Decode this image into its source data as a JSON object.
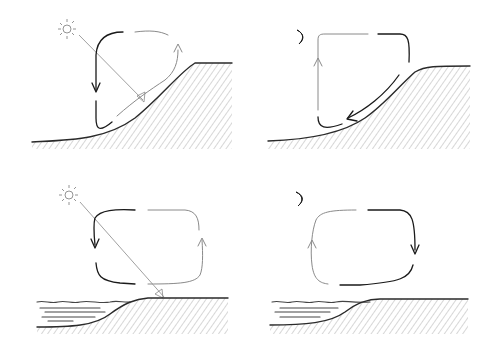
{
  "diagram": {
    "type": "atmospheric circulation sketches",
    "panels": [
      {
        "id": "day-slope",
        "celestial": "sun",
        "terrain": "slope",
        "flow": "upslope (anabatic)",
        "circulation": "counter-clockwise loop rising along heated slope"
      },
      {
        "id": "night-slope",
        "celestial": "moon",
        "terrain": "slope",
        "flow": "downslope (katabatic)",
        "circulation": "air sinks down slope, rises over valley"
      },
      {
        "id": "day-coast",
        "celestial": "sun",
        "terrain": "coast with water",
        "flow": "sea breeze",
        "circulation": "air rises over heated land, sinks over water"
      },
      {
        "id": "night-coast",
        "celestial": "moon",
        "terrain": "coast with water",
        "flow": "land breeze",
        "circulation": "air rises over water, sinks over land"
      }
    ],
    "colors": {
      "dark_stroke": "#1a1a1a",
      "light_stroke": "#8a8a8a",
      "background": "#ffffff"
    }
  }
}
